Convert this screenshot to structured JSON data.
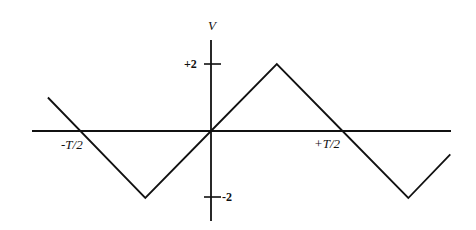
{
  "chart_data": {
    "type": "line",
    "title": "",
    "xlabel": "",
    "ylabel": "V",
    "x_tick_labels": [
      "-T/2",
      "+T/2"
    ],
    "y_tick_labels": [
      "+2",
      "-2"
    ],
    "y_ticks": [
      2,
      -2
    ],
    "x_ticks_in_T": [
      -0.5,
      0.5
    ],
    "series": [
      {
        "name": "V(t)",
        "x_in_T": [
          -0.62,
          -0.25,
          0.0,
          0.25,
          0.5,
          0.75,
          0.91
        ],
        "values": [
          1.0,
          -2,
          0,
          2,
          0,
          -2,
          -0.7
        ]
      }
    ],
    "ylim": [
      -2.7,
      2.7
    ],
    "xlim_in_T": [
      -0.68,
      0.92
    ],
    "grid": false,
    "legend": "none",
    "line_color": "#111111"
  },
  "labels": {
    "y_axis": "V",
    "y_pos": "+2",
    "y_neg": "-2",
    "x_neg": "-T/2",
    "x_pos": "+T/2"
  }
}
